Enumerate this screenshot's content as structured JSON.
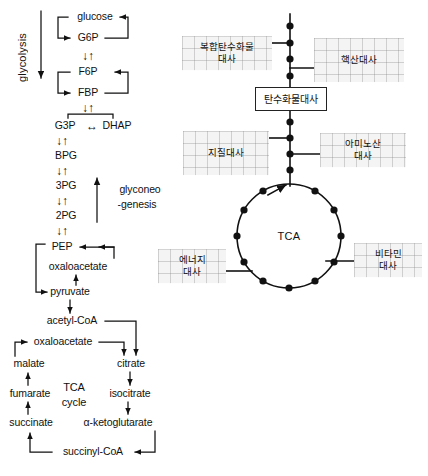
{
  "meta": {
    "ink_color": "#111111",
    "grid_label_bg": "#f4f4f4"
  },
  "left_pathway": {
    "section_labels": {
      "glycolysis": "glycolysis",
      "gluconeogenesis_line1": "glyconeo",
      "gluconeogenesis_line2": "-genesis",
      "tca_cycle_line1": "TCA",
      "tca_cycle_line2": "cycle"
    },
    "metabolites": [
      {
        "id": "glucose",
        "label": "glucose",
        "x": 95,
        "y": 17
      },
      {
        "id": "g6p",
        "label": "G6P",
        "x": 88,
        "y": 38
      },
      {
        "id": "f6p",
        "label": "F6P",
        "x": 88,
        "y": 72
      },
      {
        "id": "fbp",
        "label": "FBP",
        "x": 88,
        "y": 93
      },
      {
        "id": "g3p",
        "label": "G3P",
        "x": 65,
        "y": 126
      },
      {
        "id": "dhap",
        "label": "DHAP",
        "x": 116,
        "y": 126
      },
      {
        "id": "bpg",
        "label": "BPG",
        "x": 66,
        "y": 156
      },
      {
        "id": "pg3",
        "label": "3PG",
        "x": 66,
        "y": 186
      },
      {
        "id": "pg2",
        "label": "2PG",
        "x": 66,
        "y": 216
      },
      {
        "id": "pep",
        "label": "PEP",
        "x": 60,
        "y": 247
      },
      {
        "id": "oxaloacetate_upper",
        "label": "oxaloacetate",
        "x": 76,
        "y": 267
      },
      {
        "id": "pyruvate",
        "label": "pyruvate",
        "x": 66,
        "y": 292
      },
      {
        "id": "acetyl-coa",
        "label": "acetyl-CoA",
        "x": 70,
        "y": 321
      },
      {
        "id": "oxaloacetate_lower",
        "label": "oxaloacetate",
        "x": 63,
        "y": 342
      },
      {
        "id": "citrate",
        "label": "citrate",
        "x": 130,
        "y": 364
      },
      {
        "id": "malate",
        "label": "malate",
        "x": 28,
        "y": 364
      },
      {
        "id": "isocitrate",
        "label": "isocitrate",
        "x": 126,
        "y": 394
      },
      {
        "id": "fumarate",
        "label": "fumarate",
        "x": 27,
        "y": 394
      },
      {
        "id": "alpha-ketoglutarate",
        "label": "α-ketoglutarate",
        "x": 110,
        "y": 423
      },
      {
        "id": "succinate",
        "label": "succinate",
        "x": 29,
        "y": 423
      },
      {
        "id": "succinyl-coa",
        "label": "succinyl-CoA",
        "x": 93,
        "y": 452
      }
    ],
    "reversible_arrow_pairs": [
      {
        "between": "G6P-F6P",
        "x": 88,
        "y": 55,
        "glyph": "↓↑"
      },
      {
        "between": "FBP-G3P",
        "x": 88,
        "y": 109,
        "glyph": "↓↑"
      },
      {
        "between": "G3P-BPG",
        "x": 62,
        "y": 141,
        "glyph": "↓↑"
      },
      {
        "between": "BPG-3PG",
        "x": 62,
        "y": 171,
        "glyph": "↓↑"
      },
      {
        "between": "3PG-2PG",
        "x": 62,
        "y": 201,
        "glyph": "↓↑"
      },
      {
        "between": "2PG-PEP",
        "x": 62,
        "y": 231,
        "glyph": "↓↑"
      }
    ],
    "bidirectional": {
      "between": "G3P-DHAP",
      "x": 91,
      "y": 126,
      "glyph": "↔"
    }
  },
  "right_map": {
    "center_box": {
      "label": "탄수화물대사",
      "x": 291,
      "y": 99
    },
    "tca_center_line1": "TCA",
    "grid_labels": [
      {
        "id": "complex-carbohydrate-metabolism",
        "line1": "복합탄수화물",
        "line2": "대사",
        "x": 227,
        "y": 53
      },
      {
        "id": "nucleic-acid-metabolism",
        "line1": "핵산대사",
        "line2": "",
        "x": 359,
        "y": 60
      },
      {
        "id": "lipid-metabolism",
        "line1": "지질대사",
        "line2": "",
        "x": 226,
        "y": 153
      },
      {
        "id": "amino-acid-metabolism",
        "line1": "아미노산",
        "line2": "대사",
        "x": 363,
        "y": 150
      },
      {
        "id": "energy-metabolism",
        "line1": "에너지",
        "line2": "대사",
        "x": 192,
        "y": 266
      },
      {
        "id": "vitamin-metabolism",
        "line1": "비타민",
        "line2": "대사",
        "x": 388,
        "y": 260
      }
    ]
  }
}
